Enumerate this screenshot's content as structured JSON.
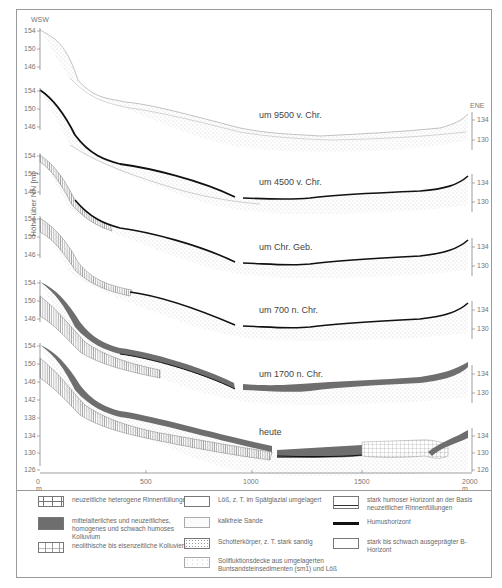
{
  "diagram": {
    "orientation": {
      "left": "WSW",
      "right": "ENE"
    },
    "y_axis_title": "Höhe über NN [m]",
    "x_axis": {
      "ticks": [
        "0 m",
        "500",
        "1000",
        "1500",
        "2000 m"
      ]
    },
    "profiles": [
      {
        "label": "um 9500 v. Chr.",
        "left_ticks": [
          "154",
          "150",
          "146"
        ],
        "right_ticks": [
          "134",
          "130"
        ]
      },
      {
        "label": "um 4500 v. Chr.",
        "left_ticks": [
          "154",
          "150",
          "146"
        ],
        "right_ticks": [
          "134",
          "130"
        ]
      },
      {
        "label": "um Chr. Geb.",
        "left_ticks": [
          "154",
          "150",
          "146"
        ],
        "right_ticks": [
          "134",
          "130"
        ]
      },
      {
        "label": "um 700 n. Chr.",
        "left_ticks": [
          "154",
          "150",
          "146"
        ],
        "right_ticks": [
          "134",
          "130"
        ]
      },
      {
        "label": "um 1700 n. Chr.",
        "left_ticks": [
          "154",
          "150",
          "146"
        ],
        "right_ticks": [
          "134",
          "130"
        ]
      },
      {
        "label": "heute",
        "left_ticks": [
          "154",
          "150",
          "146",
          "142",
          "138",
          "134",
          "130",
          "126"
        ],
        "right_ticks": [
          "134",
          "130",
          "126"
        ]
      }
    ]
  },
  "legend": {
    "items": [
      {
        "id": "rinnen",
        "text": "neuzeitliche heterogene Rinnenfüllungen"
      },
      {
        "id": "kolluvium-mittel",
        "text": "mittelalterliches und neuzeitliches, homogenes und schwach humoses Kolluvium"
      },
      {
        "id": "kolluvien-neo",
        "text": "neolithische bis eisenzeitliche Kolluvien"
      },
      {
        "id": "loess",
        "text": "Löß, z. T. im Spätglazial umgelagert"
      },
      {
        "id": "sande",
        "text": "kalkfreie Sande"
      },
      {
        "id": "schotter",
        "text": "Schotterkörper, z. T. stark sandig"
      },
      {
        "id": "solifluktion",
        "text": "Solifluktionsdecke aus umgelagerten Buntsandsteinsedimenten (sm1) und Löß"
      },
      {
        "id": "humoser-basis",
        "text": "stark humoser Horizont an der Basis neuzeitlicher Rinnenfüllungen"
      },
      {
        "id": "humus",
        "text": "Humushorizont"
      },
      {
        "id": "b-horizont",
        "text": "stark bis schwach ausgeprägter B-Horizont"
      }
    ]
  },
  "colors": {
    "frame": "#9a9a9a",
    "humus": "#111111",
    "kolluvium": "#6e6e6e",
    "dots": "#b5b5b5",
    "text": "#555555"
  }
}
